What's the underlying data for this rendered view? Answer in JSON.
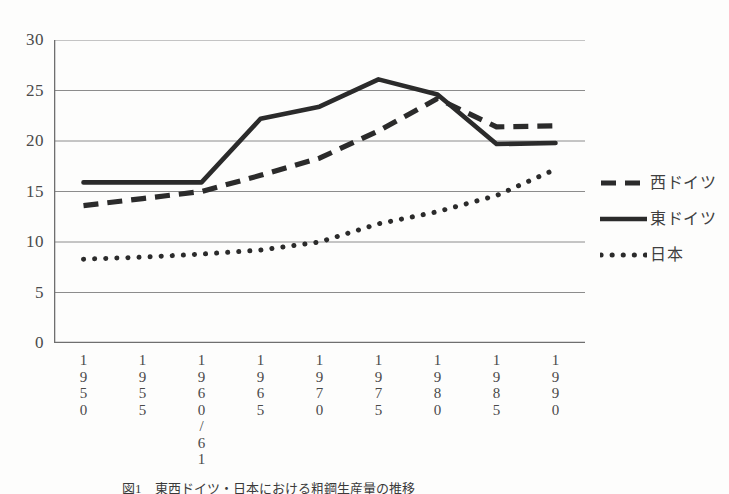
{
  "figure": {
    "caption": "図1　東西ドイツ・日本における粗鋼生産量の推移",
    "background_color": "#fdfdfc",
    "ink_color": "#2b2b2b",
    "grid_color": "#8c8c8c"
  },
  "legend": {
    "position": "right",
    "entries": [
      {
        "label": "西ドイツ",
        "style": "dashed",
        "name": "legend-west-germany"
      },
      {
        "label": "東ドイツ",
        "style": "solid",
        "name": "legend-east-germany"
      },
      {
        "label": "日本",
        "style": "dotted",
        "name": "legend-japan"
      }
    ]
  },
  "chart_data": {
    "type": "line",
    "title": "",
    "subtitle": "",
    "xlabel": "",
    "ylabel": "",
    "ylim": [
      0,
      30
    ],
    "yticks": [
      0,
      5,
      10,
      15,
      20,
      25,
      30
    ],
    "ytick_labels": [
      "0",
      "5",
      "10",
      "15",
      "20",
      "25",
      "30"
    ],
    "grid": true,
    "grid_axis": "y",
    "legend_position": "right",
    "categories": [
      "1950",
      "1955",
      "1960/61",
      "1965",
      "1970",
      "1975",
      "1980",
      "1985",
      "1990"
    ],
    "category_labels_vertical": [
      [
        "1",
        "9",
        "5",
        "0"
      ],
      [
        "1",
        "9",
        "5",
        "5"
      ],
      [
        "1",
        "9",
        "6",
        "0",
        "/",
        "6",
        "1"
      ],
      [
        "1",
        "9",
        "6",
        "5"
      ],
      [
        "1",
        "9",
        "7",
        "0"
      ],
      [
        "1",
        "9",
        "7",
        "5"
      ],
      [
        "1",
        "9",
        "8",
        "0"
      ],
      [
        "1",
        "9",
        "8",
        "5"
      ],
      [
        "1",
        "9",
        "9",
        "0"
      ]
    ],
    "series": [
      {
        "name": "西ドイツ",
        "style": "dashed",
        "values": [
          13.6,
          14.3,
          15.0,
          16.6,
          18.3,
          21.0,
          24.2,
          21.4,
          21.5
        ]
      },
      {
        "name": "東ドイツ",
        "style": "solid",
        "values": [
          15.9,
          15.9,
          15.9,
          22.2,
          23.4,
          26.1,
          24.6,
          19.7,
          19.8
        ]
      },
      {
        "name": "日本",
        "style": "dotted",
        "values": [
          8.3,
          8.5,
          8.8,
          9.2,
          10.0,
          11.8,
          13.0,
          14.6,
          17.2
        ]
      }
    ]
  }
}
